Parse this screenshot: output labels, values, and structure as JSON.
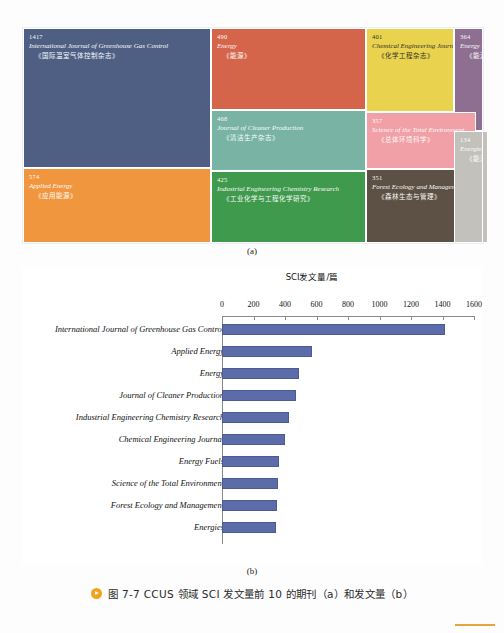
{
  "figure": {
    "caption": "图 7-7  CCUS 领域 SCI 发文量前 10 的期刊（a）和发文量（b）",
    "panel_a_label": "(a)",
    "panel_b_label": "(b)"
  },
  "treemap": {
    "cells": [
      {
        "count": "1417",
        "en": "International Journal of Greenhouse Gas Control",
        "cn": "《国际温室气体控制杂志》",
        "color": "#4f5f84"
      },
      {
        "count": "490",
        "en": "Energy",
        "cn": "《能源》",
        "color": "#d4654a"
      },
      {
        "count": "468",
        "en": "Journal of Cleaner Production",
        "cn": "《清洁生产杂志》",
        "color": "#78b3a4"
      },
      {
        "count": "401",
        "en": "Chemical Engineering Journal",
        "cn": "《化学工程杂志》",
        "color": "#e8d24e"
      },
      {
        "count": "364",
        "en": "Energy Fuels",
        "cn": "《能源燃料》",
        "color": "#8e6f92"
      },
      {
        "count": "574",
        "en": "Applied Energy",
        "cn": "《应用能源》",
        "color": "#f0963f"
      },
      {
        "count": "425",
        "en": "Industrial Engineering Chemistry Research",
        "cn": "《工业化学与工程化学研究》",
        "color": "#3f9a4e"
      },
      {
        "count": "357",
        "en": "Science of the Total Environment",
        "cn": "《总体环境科学》",
        "color": "#f0a0a6"
      },
      {
        "count": "351",
        "en": "Forest Ecology and Management",
        "cn": "《森林生态与管理》",
        "color": "#5d5044"
      },
      {
        "count": "134",
        "en": "Energies",
        "cn": "《能源》",
        "color": "#c3c1bc"
      }
    ]
  },
  "chart_data": {
    "type": "bar",
    "orientation": "horizontal",
    "title": "SCI发文量/篇",
    "xlabel": "SCI发文量/篇",
    "ylabel": "",
    "xlim": [
      0,
      1600
    ],
    "xticks": [
      "0",
      "200",
      "400",
      "600",
      "800",
      "1000",
      "1200",
      "1400",
      "1600"
    ],
    "grid": false,
    "legend": null,
    "bar_color": "#5b6ca8",
    "categories": [
      "International Journal of Greenhouse Gas Control",
      "Applied Energy",
      "Energy",
      "Journal of Cleaner Production",
      "Industrial Engineering Chemistry Research",
      "Chemical Engineering Journal",
      "Energy Fuels",
      "Science of the Total Environment",
      "Forest Ecology and Management",
      "Energies"
    ],
    "values": [
      1417,
      574,
      490,
      468,
      425,
      401,
      364,
      357,
      351,
      344
    ]
  }
}
